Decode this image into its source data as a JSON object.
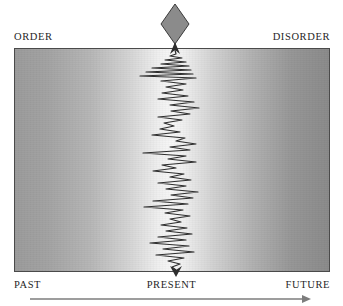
{
  "figure": {
    "type": "conceptual-diagram",
    "background_color": "#ffffff"
  },
  "axes": {
    "top_left_label": "ORDER",
    "top_right_label": "DISORDER",
    "bottom_left_label": "PAST",
    "bottom_center_label": "PRESENT",
    "bottom_right_label": "FUTURE"
  },
  "field": {
    "gradient_left_color": "#9b9b9b",
    "gradient_center_color": "#f7f7f7",
    "gradient_right_color": "#8a8a8a",
    "border_color": "#4a4a4a"
  },
  "marker": {
    "shape": "diamond",
    "fill_color": "#8b8b8b",
    "stroke_color": "#3a3a3a",
    "center_x": 175,
    "center_y": 24,
    "half_width": 14,
    "half_height": 20
  },
  "time_arrow": {
    "direction": "left-to-right",
    "color": "#7d7d7d",
    "x_start": 30,
    "x_end": 311,
    "y": 299
  },
  "chart_data": {
    "type": "line",
    "title": "",
    "xlabel": "",
    "ylabel": "",
    "orientation": "vertical",
    "grid": false,
    "legend": null,
    "axis_x_range": [
      14,
      330
    ],
    "axis_y_range": [
      48,
      272
    ],
    "x_axis_semantics": [
      "PAST",
      "PRESENT",
      "FUTURE"
    ],
    "y_axis_semantics": [
      "ORDER",
      "DISORDER"
    ],
    "series": [
      {
        "name": "uncertainty-trace",
        "color": "#2e2e2e",
        "line_width": 1.2,
        "arrow_head_top": true,
        "arrow_head_bottom": true,
        "baseline_x": 175,
        "points": [
          [
            175,
            50
          ],
          [
            176,
            54
          ],
          [
            170,
            56
          ],
          [
            182,
            58
          ],
          [
            165,
            60
          ],
          [
            186,
            62
          ],
          [
            161,
            64
          ],
          [
            189,
            66
          ],
          [
            152,
            68
          ],
          [
            191,
            70
          ],
          [
            146,
            72
          ],
          [
            193,
            74
          ],
          [
            140,
            76
          ],
          [
            196,
            78
          ],
          [
            161,
            81
          ],
          [
            186,
            84
          ],
          [
            166,
            87
          ],
          [
            183,
            90
          ],
          [
            162,
            93
          ],
          [
            188,
            96
          ],
          [
            158,
            99
          ],
          [
            194,
            102
          ],
          [
            170,
            105
          ],
          [
            199,
            108
          ],
          [
            171,
            111
          ],
          [
            190,
            114
          ],
          [
            158,
            117
          ],
          [
            182,
            120
          ],
          [
            164,
            123
          ],
          [
            174,
            126
          ],
          [
            160,
            129
          ],
          [
            180,
            132
          ],
          [
            152,
            135
          ],
          [
            185,
            138
          ],
          [
            176,
            141
          ],
          [
            196,
            144
          ],
          [
            170,
            147
          ],
          [
            190,
            150
          ],
          [
            143,
            153
          ],
          [
            186,
            156
          ],
          [
            168,
            159
          ],
          [
            196,
            162
          ],
          [
            162,
            165
          ],
          [
            176,
            168
          ],
          [
            153,
            171
          ],
          [
            184,
            174
          ],
          [
            170,
            177
          ],
          [
            191,
            180
          ],
          [
            158,
            183
          ],
          [
            186,
            186
          ],
          [
            166,
            189
          ],
          [
            198,
            192
          ],
          [
            171,
            195
          ],
          [
            193,
            198
          ],
          [
            153,
            201
          ],
          [
            188,
            204
          ],
          [
            144,
            207
          ],
          [
            183,
            210
          ],
          [
            165,
            213
          ],
          [
            190,
            216
          ],
          [
            170,
            219
          ],
          [
            181,
            222
          ],
          [
            161,
            225
          ],
          [
            187,
            228
          ],
          [
            166,
            231
          ],
          [
            192,
            234
          ],
          [
            158,
            237
          ],
          [
            186,
            240
          ],
          [
            150,
            243
          ],
          [
            189,
            246
          ],
          [
            163,
            249
          ],
          [
            194,
            252
          ],
          [
            156,
            255
          ],
          [
            184,
            258
          ],
          [
            168,
            261
          ],
          [
            180,
            264
          ],
          [
            172,
            267
          ],
          [
            176,
            270
          ]
        ]
      }
    ]
  }
}
